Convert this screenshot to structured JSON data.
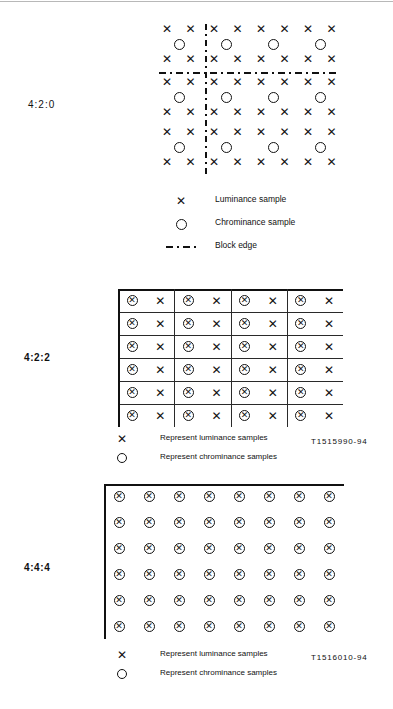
{
  "document": {
    "title": "Chroma sampling patterns",
    "figure_refs": {
      "ref_422": "T1515990-94",
      "ref_444": "T1516010-94"
    }
  },
  "sections": {
    "s420": {
      "label": "4:2:0",
      "legend": [
        {
          "symbol": "x-icon",
          "text": "Luminance sample"
        },
        {
          "symbol": "circle-icon",
          "text": "Chrominance sample"
        },
        {
          "symbol": "dash-dot-line-icon",
          "text": "Block edge"
        }
      ]
    },
    "s422": {
      "label": "4:2:2",
      "legend": [
        {
          "symbol": "x-icon",
          "text": "Represent luminance samples"
        },
        {
          "symbol": "circle-icon",
          "text": "Represent chrominance samples"
        }
      ]
    },
    "s444": {
      "label": "4:4:4",
      "legend": [
        {
          "symbol": "x-icon",
          "text": "Represent luminance samples"
        },
        {
          "symbol": "circle-icon",
          "text": "Represent chrominance samples"
        }
      ]
    }
  },
  "chart_data": {
    "type": "scatter",
    "xlabel": "",
    "ylabel": "",
    "panels": [
      {
        "name": "4:2:0",
        "luminance_columns": 8,
        "luminance_rows": 6,
        "chrominance_columns": 4,
        "chrominance_rows": 3,
        "block_edges": {
          "vertical": 1,
          "horizontal": 1
        },
        "description": "Luminance sample at every pixel; one chrominance sample per 2x2 luminance block, positioned at block centre."
      },
      {
        "name": "4:2:2",
        "luminance_columns": 8,
        "luminance_rows": 6,
        "chrominance_columns": 4,
        "chrominance_rows": 6,
        "block_edges": {
          "vertical": 3,
          "horizontal": 5
        },
        "description": "Luminance sample at every pixel; chrominance co-sited with every second luminance sample horizontally."
      },
      {
        "name": "4:4:4",
        "luminance_columns": 8,
        "luminance_rows": 6,
        "chrominance_columns": 8,
        "chrominance_rows": 6,
        "block_edges": {
          "vertical": 0,
          "horizontal": 0
        },
        "description": "Luminance and chrominance co-sited at every pixel."
      }
    ],
    "legend": [
      "Luminance sample",
      "Chrominance sample",
      "Block edge"
    ]
  }
}
